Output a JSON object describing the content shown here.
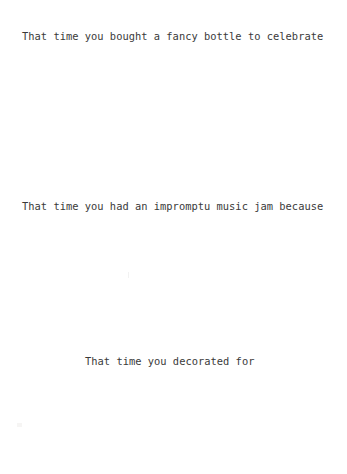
{
  "page": {
    "background_color": "#ffffff",
    "text_color": "#3a3a3a",
    "width": 347,
    "height": 474
  },
  "lines": [
    {
      "id": "line-1",
      "text": "That time you bought a fancy bottle to celebrate"
    },
    {
      "id": "line-2",
      "text": "That time you had an impromptu music jam because"
    },
    {
      "id": "line-3",
      "text": "That time you decorated for"
    }
  ]
}
